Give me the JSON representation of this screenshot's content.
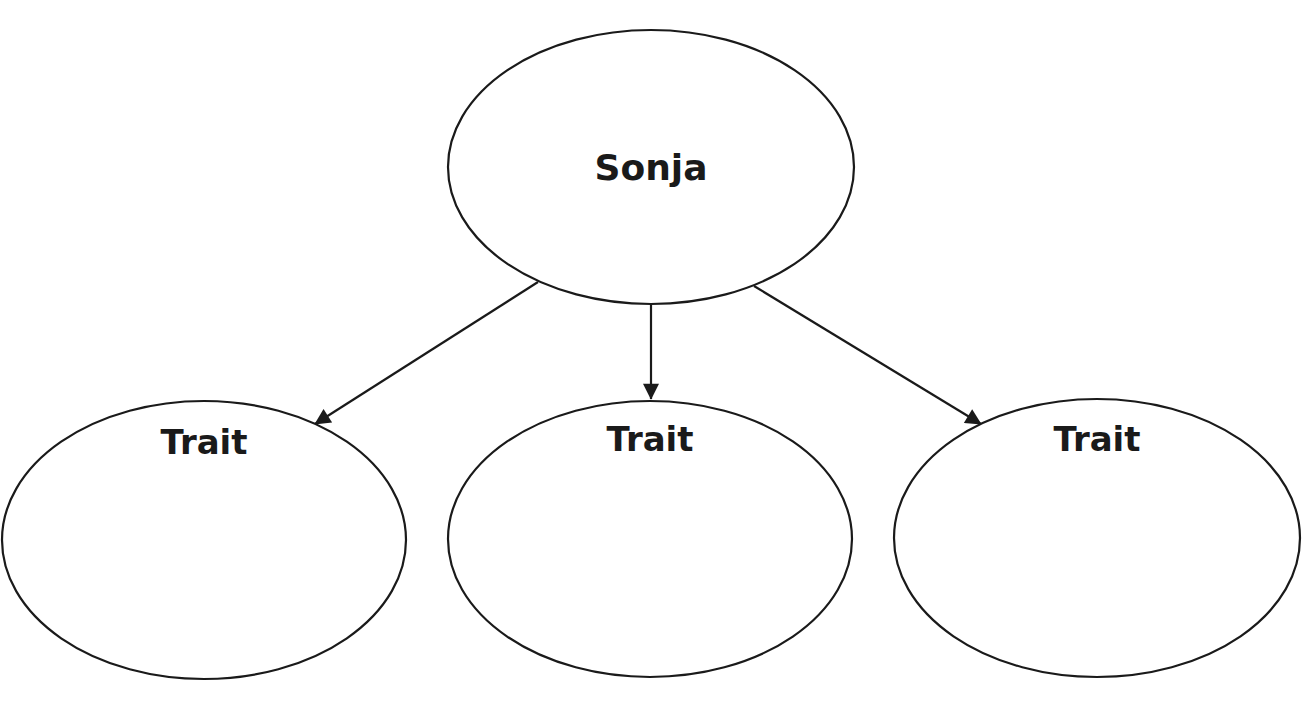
{
  "diagram": {
    "type": "character-trait-web",
    "colors": {
      "stroke": "#1a1a1a",
      "background": "#ffffff",
      "text": "#1a1a1a"
    },
    "center_node": {
      "label": "Sonja",
      "cx": 651,
      "cy": 167,
      "rx": 203,
      "ry": 137,
      "label_x": 651,
      "label_y": 180,
      "font_size": 36
    },
    "trait_nodes": [
      {
        "label": "Trait",
        "cx": 204,
        "cy": 540,
        "rx": 202,
        "ry": 139,
        "label_x": 204,
        "label_y": 454,
        "font_size": 34
      },
      {
        "label": "Trait",
        "cx": 650,
        "cy": 539,
        "rx": 202,
        "ry": 138,
        "label_x": 650,
        "label_y": 451,
        "font_size": 34
      },
      {
        "label": "Trait",
        "cx": 1097,
        "cy": 538,
        "rx": 203,
        "ry": 139,
        "label_x": 1097,
        "label_y": 451,
        "font_size": 34
      }
    ],
    "arrows": [
      {
        "from": "Sonja",
        "to": "Trait 1",
        "x1": 538,
        "y1": 282,
        "x2": 315,
        "y2": 424
      },
      {
        "from": "Sonja",
        "to": "Trait 2",
        "x1": 651,
        "y1": 305,
        "x2": 651,
        "y2": 399
      },
      {
        "from": "Sonja",
        "to": "Trait 3",
        "x1": 754,
        "y1": 286,
        "x2": 981,
        "y2": 424
      }
    ]
  }
}
